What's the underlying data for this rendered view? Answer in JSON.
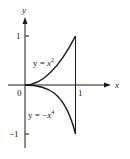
{
  "figure": {
    "axes": {
      "x_label": "x",
      "y_label": "y",
      "origin_label": "0",
      "x_tick_label": "1",
      "y_tick_pos_label": "1",
      "y_tick_neg_label": "−1"
    },
    "curves": [
      {
        "name": "upper",
        "label_prefix": "y = ",
        "label_var": "x",
        "label_exp": "2"
      },
      {
        "name": "lower",
        "label_prefix": "y = −",
        "label_var": "x",
        "label_exp": "4"
      }
    ],
    "colors": {
      "ink": "#1a1a1a",
      "background": "#ffffff"
    }
  }
}
